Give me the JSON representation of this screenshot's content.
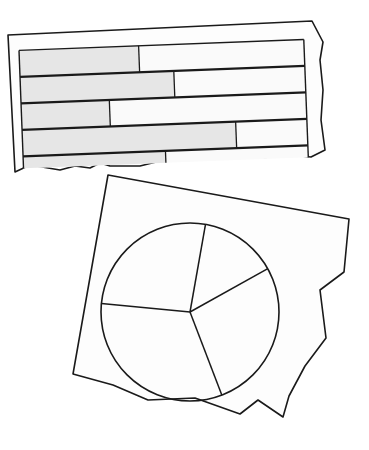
{
  "illustration": {
    "description": "Two torn paper fragments: one with a horizontal stacked bar chart, one with a pie chart",
    "colors": {
      "background": "#ffffff",
      "paper": "#fdfdfd",
      "stroke": "#1a1a1a",
      "bar_fill": "#e6e6e6",
      "bar_empty": "#fafafa"
    }
  },
  "chart_data": [
    {
      "type": "bar",
      "orientation": "horizontal",
      "title": "",
      "xlabel": "",
      "ylabel": "",
      "categories": [
        "bar-1",
        "bar-2",
        "bar-3",
        "bar-4",
        "bar-5 (torn)"
      ],
      "values": [
        42,
        54,
        31,
        75,
        50
      ],
      "unit": "percent of row filled",
      "xlim": [
        0,
        100
      ],
      "grid": false,
      "legend": null
    },
    {
      "type": "pie",
      "title": "",
      "labels": [
        "slice-1",
        "slice-2",
        "slice-3",
        "slice-4"
      ],
      "values": [
        14,
        27,
        32,
        26
      ],
      "start_angle_deg": -80,
      "direction": "clockwise",
      "legend": null
    }
  ]
}
